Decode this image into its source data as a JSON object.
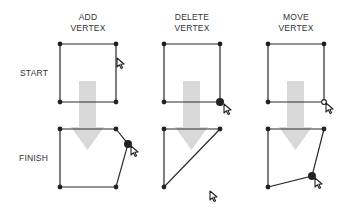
{
  "columns": [
    {
      "title_line1": "ADD",
      "title_line2": "VERTEX"
    },
    {
      "title_line1": "DELETE",
      "title_line2": "VERTEX"
    },
    {
      "title_line1": "MOVE",
      "title_line2": "VERTEX"
    }
  ],
  "rows": {
    "start_label": "START",
    "finish_label": "FINISH"
  },
  "colors": {
    "line": "#2a2a2a",
    "arrow": "#d9d9d9",
    "text": "#333333"
  },
  "icons": [
    "cursor-arrow-icon",
    "vertex-dot-icon",
    "down-arrow-icon"
  ]
}
